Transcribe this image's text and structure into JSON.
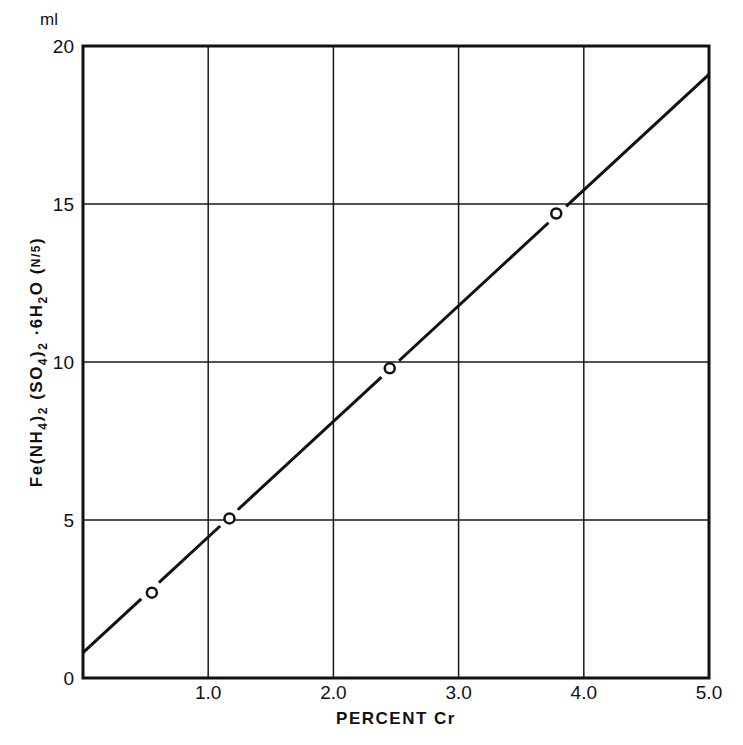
{
  "chart_data": {
    "type": "scatter",
    "title": "",
    "xlabel": "PERCENT Cr",
    "ylabel": "Fe(NH4)2(SO4)2·6H2O (N/5)",
    "ylabel_parts": {
      "main": "Fe(NH",
      "sub1": "4",
      "mid1": ")",
      "sub2": "2",
      "mid2": "(SO",
      "sub3": "4",
      "mid3": ")",
      "sub4": "2",
      "mid4": "·6H",
      "sub5": "2",
      "mid5": "O (",
      "frac_num": "N",
      "frac_den": "5",
      "end": ")"
    },
    "y_unit": "ml",
    "xlim": [
      0,
      5.0
    ],
    "ylim": [
      0,
      20
    ],
    "grid": true,
    "x_ticks": [
      0,
      1.0,
      2.0,
      3.0,
      4.0,
      5.0
    ],
    "x_tick_labels": [
      "",
      "1.0",
      "2.0",
      "3.0",
      "4.0",
      "5.0"
    ],
    "y_ticks": [
      0,
      5,
      10,
      15,
      20
    ],
    "y_tick_labels": [
      "0",
      "5",
      "10",
      "15",
      "20"
    ],
    "series": [
      {
        "name": "measured",
        "marker": "open-circle",
        "x": [
          0.55,
          1.17,
          2.45,
          3.78
        ],
        "y": [
          2.7,
          5.05,
          9.8,
          14.7
        ]
      },
      {
        "name": "fit line",
        "style": "line",
        "x": [
          0,
          5.0
        ],
        "y": [
          0.8,
          19.1
        ]
      }
    ],
    "legend": null
  }
}
